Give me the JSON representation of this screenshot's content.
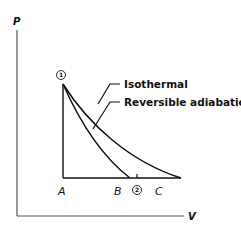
{
  "figure": {
    "type": "P-V diagram",
    "axes": {
      "y_label": "P",
      "x_label": "V"
    },
    "curves": [
      {
        "name": "isothermal",
        "label": "Isothermal",
        "from": "1",
        "to": "C"
      },
      {
        "name": "reversible-adiabatic",
        "label": "Reversible adiabatic",
        "from": "1",
        "to": "B"
      }
    ],
    "points": {
      "state1": "1",
      "state2": "2",
      "A": "A",
      "B": "B",
      "C": "C"
    },
    "colors": {
      "line": "#111111",
      "background": "#ffffff"
    }
  }
}
